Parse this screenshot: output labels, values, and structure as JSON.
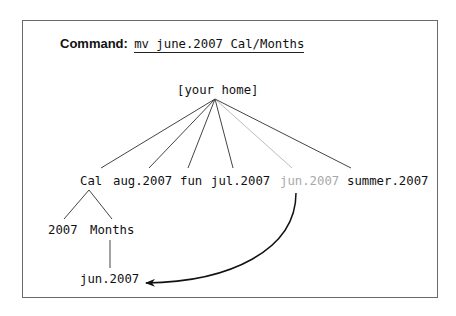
{
  "command": {
    "label": "Command:",
    "text": "mv june.2007 Cal/Months"
  },
  "tree": {
    "root": "[your home]",
    "children": [
      {
        "name": "Cal",
        "state": "normal"
      },
      {
        "name": "aug.2007",
        "state": "normal"
      },
      {
        "name": "fun",
        "state": "normal"
      },
      {
        "name": "jul.2007",
        "state": "normal"
      },
      {
        "name": "jun.2007",
        "state": "moved-from"
      },
      {
        "name": "summer.2007",
        "state": "normal"
      }
    ],
    "cal_children": [
      "2007",
      "Months"
    ],
    "months_children": [
      "jun.2007"
    ]
  },
  "colors": {
    "line": "#444444",
    "ghost": "#a9a9a9",
    "border": "#6a6a6a"
  }
}
